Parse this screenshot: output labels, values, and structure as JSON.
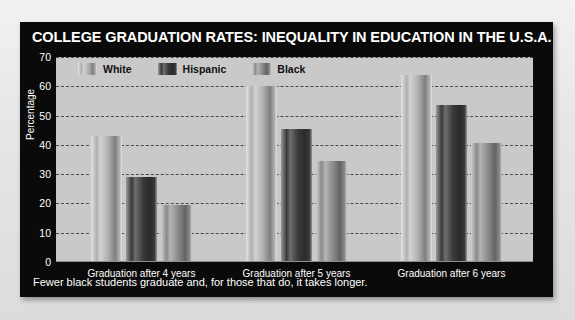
{
  "title": "COLLEGE GRADUATION RATES: INEQUALITY IN EDUCATION IN THE U.S.A.",
  "caption": "Fewer black students graduate and, for those that do, it takes longer.",
  "colors": {
    "panel": "#0a0a0a",
    "plot_background": "#c9c9c9",
    "grid": "#4a4a4a",
    "white_series": "#b0b0b0",
    "hispanic_series": "#3a3a3a",
    "black_series": "#8a8a8a",
    "text_light": "#ffffff"
  },
  "chart_data": {
    "type": "bar",
    "title": "COLLEGE GRADUATION RATES: INEQUALITY IN EDUCATION IN THE U.S.A.",
    "xlabel": "",
    "ylabel": "Percentage",
    "ylim": [
      0,
      70
    ],
    "yticks": [
      0,
      10,
      20,
      30,
      40,
      50,
      60,
      70
    ],
    "grid": true,
    "legend_position": "top-left",
    "categories": [
      "Graduation after 4 years",
      "Graduation after 5 years",
      "Graduation after 6 years"
    ],
    "series": [
      {
        "name": "White",
        "values": [
          43,
          60,
          64
        ]
      },
      {
        "name": "Hispanic",
        "values": [
          29,
          45.5,
          53.5
        ]
      },
      {
        "name": "Black",
        "values": [
          19.5,
          34.5,
          40.5
        ]
      }
    ]
  }
}
